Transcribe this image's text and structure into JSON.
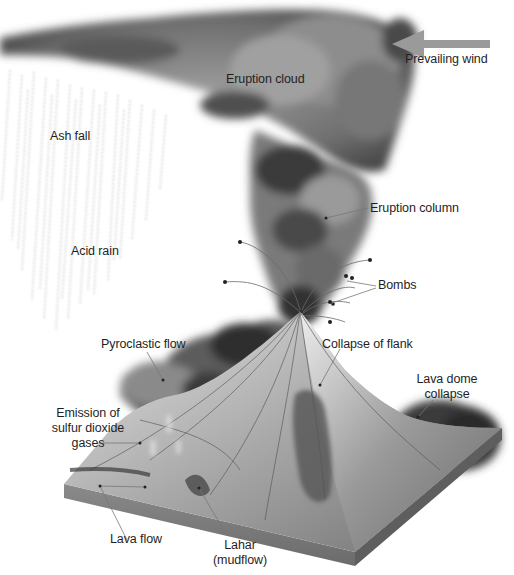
{
  "diagram": {
    "colors": {
      "background": "#ffffff",
      "smoke_dark": "#2e2e2e",
      "smoke_mid": "#6e6e6e",
      "smoke_light": "#a9a9a9",
      "terrain_light": "#c9c9c9",
      "terrain_mid": "#8f8f8f",
      "terrain_dark": "#555555",
      "base_side": "#7d7d7d",
      "wind_arrow": "#9a9a9a",
      "label_text": "#1f1f1f",
      "leader_line": "#777777"
    },
    "wind": {
      "label": "Prevailing wind",
      "arrow_direction": "left"
    },
    "labels": {
      "eruption_cloud": "Eruption cloud",
      "ash_fall": "Ash fall",
      "acid_rain": "Acid rain",
      "eruption_column": "Eruption column",
      "bombs": "Bombs",
      "pyroclastic_flow": "Pyroclastic flow",
      "collapse_of_flank": "Collapse of flank",
      "lava_dome_collapse_line1": "Lava dome",
      "lava_dome_collapse_line2": "collapse",
      "emission_line1": "Emission of",
      "emission_line2": "sulfur dioxide",
      "emission_line3": "gases",
      "lava_flow": "Lava flow",
      "lahar_line1": "Lahar",
      "lahar_line2": "(mudflow)"
    }
  }
}
